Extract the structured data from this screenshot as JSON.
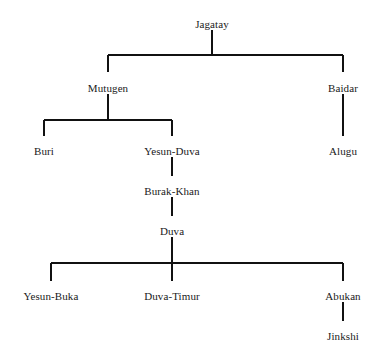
{
  "diagram": {
    "type": "family-tree",
    "title": "",
    "background_color": "#ffffff",
    "line_color": "#111111",
    "text_color": "#1a1a1a",
    "nodes": [
      {
        "id": "jagatay",
        "label": "Jagatay",
        "x": 212,
        "y": 18,
        "generation": 1
      },
      {
        "id": "mutugen",
        "label": "Mutugen",
        "x": 108,
        "y": 82,
        "generation": 2
      },
      {
        "id": "baidar",
        "label": "Baidar",
        "x": 343,
        "y": 82,
        "generation": 2
      },
      {
        "id": "buri",
        "label": "Buri",
        "x": 44,
        "y": 145,
        "generation": 3
      },
      {
        "id": "yesun-duva",
        "label": "Yesun-Duva",
        "x": 172,
        "y": 145,
        "generation": 3
      },
      {
        "id": "alugu",
        "label": "Alugu",
        "x": 343,
        "y": 145,
        "generation": 3
      },
      {
        "id": "burak-khan",
        "label": "Burak-Khan",
        "x": 172,
        "y": 185,
        "generation": 4
      },
      {
        "id": "duva",
        "label": "Duva",
        "x": 172,
        "y": 225,
        "generation": 5
      },
      {
        "id": "yesun-buka",
        "label": "Yesun-Buka",
        "x": 51,
        "y": 290,
        "generation": 6
      },
      {
        "id": "duva-timur",
        "label": "Duva-Timur",
        "x": 172,
        "y": 290,
        "generation": 6
      },
      {
        "id": "abukan",
        "label": "Abukan",
        "x": 343,
        "y": 290,
        "generation": 6
      },
      {
        "id": "jinkshi",
        "label": "Jinkshi",
        "x": 343,
        "y": 330,
        "generation": 7
      }
    ],
    "edges": [
      {
        "from": "jagatay",
        "to": "mutugen"
      },
      {
        "from": "jagatay",
        "to": "baidar"
      },
      {
        "from": "mutugen",
        "to": "buri"
      },
      {
        "from": "mutugen",
        "to": "yesun-duva"
      },
      {
        "from": "baidar",
        "to": "alugu"
      },
      {
        "from": "yesun-duva",
        "to": "burak-khan"
      },
      {
        "from": "burak-khan",
        "to": "duva"
      },
      {
        "from": "duva",
        "to": "yesun-buka"
      },
      {
        "from": "duva",
        "to": "duva-timur"
      },
      {
        "from": "duva",
        "to": "abukan"
      },
      {
        "from": "abukan",
        "to": "jinkshi"
      }
    ],
    "connectors": [
      {
        "name": "jagatay-stem",
        "orientation": "vertical",
        "x1": 212,
        "y1": 30,
        "x2": 212,
        "y2": 55
      },
      {
        "name": "jagatay-bus",
        "orientation": "horizontal",
        "x1": 108,
        "y1": 55,
        "x2": 343,
        "y2": 55
      },
      {
        "name": "mutugen-drop",
        "orientation": "vertical",
        "x1": 108,
        "y1": 55,
        "x2": 108,
        "y2": 72
      },
      {
        "name": "baidar-drop",
        "orientation": "vertical",
        "x1": 343,
        "y1": 55,
        "x2": 343,
        "y2": 72
      },
      {
        "name": "mutugen-stem",
        "orientation": "vertical",
        "x1": 108,
        "y1": 94,
        "x2": 108,
        "y2": 120
      },
      {
        "name": "mutugen-bus",
        "orientation": "horizontal",
        "x1": 44,
        "y1": 120,
        "x2": 172,
        "y2": 120
      },
      {
        "name": "buri-drop",
        "orientation": "vertical",
        "x1": 44,
        "y1": 120,
        "x2": 44,
        "y2": 136
      },
      {
        "name": "yesun-duva-drop",
        "orientation": "vertical",
        "x1": 172,
        "y1": 120,
        "x2": 172,
        "y2": 136
      },
      {
        "name": "baidar-alugu-stem",
        "orientation": "vertical",
        "x1": 343,
        "y1": 94,
        "x2": 343,
        "y2": 136
      },
      {
        "name": "yesun-duva-stem",
        "orientation": "vertical",
        "x1": 172,
        "y1": 157,
        "x2": 172,
        "y2": 176
      },
      {
        "name": "burak-khan-stem",
        "orientation": "vertical",
        "x1": 172,
        "y1": 197,
        "x2": 172,
        "y2": 216
      },
      {
        "name": "duva-stem",
        "orientation": "vertical",
        "x1": 172,
        "y1": 237,
        "x2": 172,
        "y2": 281
      },
      {
        "name": "duva-bus",
        "orientation": "horizontal",
        "x1": 51,
        "y1": 263,
        "x2": 343,
        "y2": 263
      },
      {
        "name": "yesun-buka-drop",
        "orientation": "vertical",
        "x1": 51,
        "y1": 263,
        "x2": 51,
        "y2": 281
      },
      {
        "name": "abukan-drop",
        "orientation": "vertical",
        "x1": 343,
        "y1": 263,
        "x2": 343,
        "y2": 281
      },
      {
        "name": "abukan-jinkshi-stem",
        "orientation": "vertical",
        "x1": 343,
        "y1": 302,
        "x2": 343,
        "y2": 321
      }
    ]
  }
}
